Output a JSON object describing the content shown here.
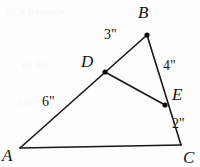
{
  "figure": {
    "background_color": "#fdfdfd",
    "ink_color": "#1a1614",
    "ghost_text": {
      "line1": "of a triangle",
      "line2": "to the",
      "line3": "and"
    },
    "vertices": [
      {
        "id": "A",
        "label": "A",
        "x": 20,
        "y": 148,
        "label_x": 2,
        "label_y": 147,
        "dot": false
      },
      {
        "id": "B",
        "label": "B",
        "x": 147,
        "y": 35,
        "label_x": 138,
        "label_y": 4,
        "dot": true
      },
      {
        "id": "C",
        "label": "C",
        "x": 181,
        "y": 145,
        "label_x": 183,
        "label_y": 149,
        "dot": false
      },
      {
        "id": "D",
        "label": "D",
        "x": 105,
        "y": 72,
        "label_x": 81,
        "label_y": 53,
        "dot": true
      },
      {
        "id": "E",
        "label": "E",
        "x": 165,
        "y": 105,
        "label_x": 172,
        "label_y": 86,
        "dot": true
      }
    ],
    "edges": [
      {
        "id": "AB",
        "from": "A",
        "to": "B"
      },
      {
        "id": "AC",
        "from": "A",
        "to": "C"
      },
      {
        "id": "BC",
        "from": "B",
        "to": "C"
      },
      {
        "id": "DE",
        "from": "D",
        "to": "E"
      }
    ],
    "measurements": [
      {
        "id": "AD",
        "text": "6\"",
        "x": 42,
        "y": 95,
        "segment": "A to D"
      },
      {
        "id": "DB",
        "text": "3\"",
        "x": 104,
        "y": 28,
        "segment": "D to B"
      },
      {
        "id": "BE",
        "text": "4\"",
        "x": 163,
        "y": 59,
        "segment": "B to E"
      },
      {
        "id": "EC",
        "text": "2\"",
        "x": 172,
        "y": 117,
        "segment": "E to C"
      }
    ]
  }
}
